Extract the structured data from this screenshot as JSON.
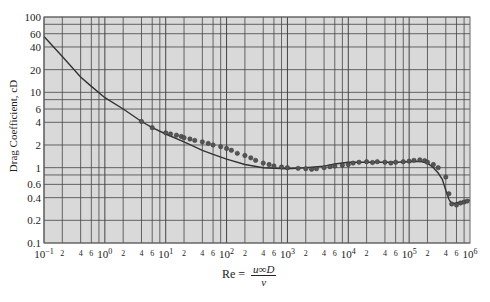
{
  "chart_data": {
    "type": "line",
    "title": "",
    "xlabel": "Re = u∞D / ν",
    "xlabel_parts": {
      "lhs": "Re =",
      "numerator": "u∞D",
      "denominator": "ν"
    },
    "ylabel": "Drag Coefficient, cD",
    "xscale": "log",
    "yscale": "log",
    "xlim": [
      0.1,
      1000000
    ],
    "ylim": [
      0.1,
      100
    ],
    "grid": true,
    "background": "#d9d9d9",
    "y_ticks": [
      {
        "value": 100,
        "label": "100"
      },
      {
        "value": 60,
        "label": "60"
      },
      {
        "value": 40,
        "label": "40"
      },
      {
        "value": 20,
        "label": "20"
      },
      {
        "value": 10,
        "label": "10"
      },
      {
        "value": 6,
        "label": "6"
      },
      {
        "value": 4,
        "label": "4"
      },
      {
        "value": 2,
        "label": "2"
      },
      {
        "value": 1,
        "label": "1"
      },
      {
        "value": 0.6,
        "label": "0.6"
      },
      {
        "value": 0.4,
        "label": "0.4"
      },
      {
        "value": 0.2,
        "label": "0.2"
      },
      {
        "value": 0.1,
        "label": "0.1"
      }
    ],
    "x_decades": [
      {
        "value": 0.1,
        "base": "10",
        "exp": "−1"
      },
      {
        "value": 1,
        "base": "10",
        "exp": "0"
      },
      {
        "value": 10,
        "base": "10",
        "exp": "1"
      },
      {
        "value": 100,
        "base": "10",
        "exp": "2"
      },
      {
        "value": 1000,
        "base": "10",
        "exp": "3"
      },
      {
        "value": 10000,
        "base": "10",
        "exp": "4"
      },
      {
        "value": 100000,
        "base": "10",
        "exp": "5"
      },
      {
        "value": 1000000,
        "base": "10",
        "exp": "6"
      }
    ],
    "x_minor_labels": [
      "2",
      "4",
      "6"
    ],
    "series": [
      {
        "name": "Smooth sphere curve",
        "x": [
          0.1,
          0.2,
          0.4,
          0.6,
          1,
          2,
          4,
          6,
          10,
          20,
          40,
          60,
          100,
          200,
          400,
          600,
          1000,
          2000,
          4000,
          6000,
          10000,
          20000,
          40000,
          60000,
          100000,
          150000,
          200000,
          250000,
          300000,
          350000,
          400000,
          450000,
          500000,
          700000,
          1000000
        ],
        "y": [
          55,
          30,
          16,
          12,
          8.5,
          6,
          4.1,
          3.4,
          2.8,
          2.2,
          1.7,
          1.5,
          1.3,
          1.1,
          1.0,
          0.98,
          0.97,
          1.0,
          1.05,
          1.12,
          1.18,
          1.18,
          1.18,
          1.18,
          1.2,
          1.22,
          1.15,
          1.0,
          0.85,
          0.7,
          0.5,
          0.38,
          0.33,
          0.35,
          0.37
        ]
      },
      {
        "name": "Experimental data points",
        "x": [
          4,
          6,
          10,
          12,
          15,
          18,
          20,
          25,
          30,
          40,
          50,
          60,
          80,
          100,
          120,
          150,
          200,
          250,
          300,
          400,
          500,
          600,
          800,
          1000,
          1500,
          2000,
          2500,
          3000,
          4000,
          5000,
          6000,
          8000,
          10000,
          12000,
          15000,
          20000,
          25000,
          30000,
          40000,
          50000,
          60000,
          80000,
          100000,
          120000,
          150000,
          180000,
          200000,
          250000,
          300000,
          400000,
          450000,
          500000,
          600000,
          700000,
          800000,
          900000
        ],
        "y": [
          4.1,
          3.4,
          2.9,
          2.8,
          2.7,
          2.6,
          2.5,
          2.4,
          2.3,
          2.2,
          2.1,
          2.0,
          1.9,
          1.8,
          1.7,
          1.55,
          1.45,
          1.35,
          1.25,
          1.15,
          1.1,
          1.05,
          1.02,
          1.0,
          0.98,
          0.97,
          0.95,
          0.97,
          1.0,
          1.03,
          1.05,
          1.08,
          1.1,
          1.15,
          1.18,
          1.2,
          1.17,
          1.2,
          1.18,
          1.15,
          1.18,
          1.2,
          1.22,
          1.25,
          1.27,
          1.24,
          1.18,
          1.1,
          1.0,
          0.75,
          0.45,
          0.33,
          0.32,
          0.34,
          0.35,
          0.36
        ]
      }
    ]
  }
}
